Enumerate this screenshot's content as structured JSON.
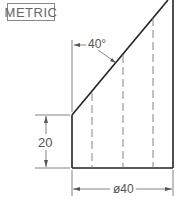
{
  "badge": {
    "label": "METRIC"
  },
  "dimensions": {
    "angle": "40°",
    "height": "20",
    "diameter": "ø40"
  },
  "colors": {
    "object_line": "#222222",
    "dimension_line": "#777777",
    "hidden_line": "#777777",
    "background": "#ffffff"
  }
}
